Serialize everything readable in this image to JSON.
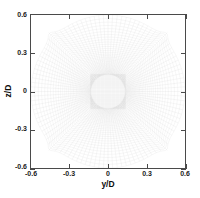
{
  "figure": {
    "type": "computational-mesh-plot",
    "background_color": "#ffffff",
    "frame_color": "#4a4a4a",
    "grid_line_color": "#c8c8c8"
  },
  "axes": {
    "x": {
      "label": "y/D",
      "min": -0.6,
      "max": 0.6,
      "ticks": [
        -0.6,
        -0.3,
        0,
        0.3,
        0.6
      ],
      "tick_labels": [
        "-0.6",
        "-0.3",
        "0",
        "0.3",
        "0.6"
      ]
    },
    "y": {
      "label": "z/D",
      "min": -0.6,
      "max": 0.6,
      "ticks": [
        -0.6,
        -0.3,
        0,
        0.3,
        0.6
      ],
      "tick_labels": [
        "-0.6",
        "-0.3",
        "0",
        "0.3",
        "0.6"
      ]
    }
  },
  "chart_data": {
    "type": "mesh",
    "title": "",
    "subtitle": "",
    "xlabel": "y/D",
    "ylabel": "z/D",
    "xlim": [
      -0.6,
      0.6
    ],
    "ylim": [
      -0.6,
      0.6
    ],
    "xticks": [
      -0.6,
      -0.3,
      0,
      0.3,
      0.6
    ],
    "yticks": [
      -0.6,
      -0.3,
      0,
      0.3,
      0.6
    ],
    "grid": false,
    "legend": "none",
    "topology": "butterfly-o-grid",
    "inner_block": {
      "shape": "cartesian",
      "half_width": 0.135,
      "half_height": 0.135,
      "nx": 26,
      "ny": 26
    },
    "radial_zone": {
      "shape": "polar",
      "r_inner": 0.135,
      "r_outer": 0.62,
      "n_radial_rings": 34,
      "n_azimuthal_rays": 104,
      "clustering": "geometric-expansion-outward",
      "expansion_ratio": 1.055
    },
    "outer_boundary": {
      "shape": "square",
      "x_range": [
        -0.6,
        0.6
      ],
      "y_range": [
        -0.6,
        0.6
      ]
    },
    "center": [
      0,
      0
    ]
  }
}
